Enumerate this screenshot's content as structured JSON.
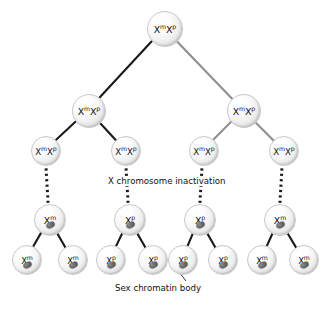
{
  "diagram": {
    "background": "#ffffff",
    "edge_color_dark": "#1a1a1a",
    "edge_color_light": "#8f8f8f",
    "chromatin_color": "#4a4a4a",
    "node_fill": "#f0f0f0"
  },
  "captions": {
    "inactivation": "X chromosome inactivation",
    "chromatin": "Sex chromatin body"
  },
  "generations": [
    {
      "level": 1,
      "nodes": [
        {
          "id": "g1n1",
          "x": 164,
          "y": 28,
          "r": 17,
          "size": "big",
          "allele1": "X",
          "sup1": "m",
          "allele2": "X",
          "sup2": "p",
          "chromatin": false
        }
      ]
    },
    {
      "level": 2,
      "nodes": [
        {
          "id": "g2n1",
          "x": 88,
          "y": 110,
          "r": 16,
          "size": "big",
          "allele1": "X",
          "sup1": "m",
          "allele2": "X",
          "sup2": "p",
          "chromatin": false
        },
        {
          "id": "g2n2",
          "x": 243,
          "y": 110,
          "r": 16,
          "size": "big",
          "allele1": "X",
          "sup1": "m",
          "allele2": "X",
          "sup2": "p",
          "chromatin": false
        }
      ]
    },
    {
      "level": 3,
      "nodes": [
        {
          "id": "g3n1",
          "x": 45,
          "y": 150,
          "r": 14,
          "size": "small",
          "allele1": "X",
          "sup1": "m",
          "allele2": "X",
          "sup2": "p",
          "chromatin": false
        },
        {
          "id": "g3n2",
          "x": 125,
          "y": 150,
          "r": 14,
          "size": "small",
          "allele1": "X",
          "sup1": "m",
          "allele2": "X",
          "sup2": "p",
          "chromatin": false
        },
        {
          "id": "g3n3",
          "x": 203,
          "y": 150,
          "r": 14,
          "size": "small",
          "allele1": "X",
          "sup1": "m",
          "allele2": "X",
          "sup2": "p",
          "chromatin": false
        },
        {
          "id": "g3n4",
          "x": 283,
          "y": 150,
          "r": 14,
          "size": "small",
          "allele1": "X",
          "sup1": "m",
          "allele2": "X",
          "sup2": "p",
          "chromatin": false
        }
      ]
    },
    {
      "level": 4,
      "nodes": [
        {
          "id": "g4n1",
          "x": 49,
          "y": 219,
          "r": 15,
          "size": "big",
          "allele1": "X",
          "sup1": "m",
          "allele2": "",
          "sup2": "",
          "chromatin": true
        },
        {
          "id": "g4n2",
          "x": 129,
          "y": 219,
          "r": 15,
          "size": "big",
          "allele1": "X",
          "sup1": "p",
          "allele2": "",
          "sup2": "",
          "chromatin": true
        },
        {
          "id": "g4n3",
          "x": 199,
          "y": 219,
          "r": 15,
          "size": "big",
          "allele1": "X",
          "sup1": "p",
          "allele2": "",
          "sup2": "",
          "chromatin": true
        },
        {
          "id": "g4n4",
          "x": 279,
          "y": 219,
          "r": 15,
          "size": "big",
          "allele1": "X",
          "sup1": "m",
          "allele2": "",
          "sup2": "",
          "chromatin": true
        }
      ]
    },
    {
      "level": 5,
      "nodes": [
        {
          "id": "g5n1",
          "x": 26,
          "y": 259,
          "r": 14,
          "size": "small",
          "allele1": "X",
          "sup1": "m",
          "allele2": "",
          "sup2": "",
          "chromatin": true
        },
        {
          "id": "g5n2",
          "x": 72,
          "y": 259,
          "r": 14,
          "size": "small",
          "allele1": "X",
          "sup1": "m",
          "allele2": "",
          "sup2": "",
          "chromatin": true
        },
        {
          "id": "g5n3",
          "x": 110,
          "y": 259,
          "r": 14,
          "size": "small",
          "allele1": "X",
          "sup1": "p",
          "allele2": "",
          "sup2": "",
          "chromatin": true
        },
        {
          "id": "g5n4",
          "x": 152,
          "y": 259,
          "r": 14,
          "size": "small",
          "allele1": "X",
          "sup1": "p",
          "allele2": "",
          "sup2": "",
          "chromatin": true
        },
        {
          "id": "g5n5",
          "x": 182,
          "y": 259,
          "r": 14,
          "size": "small",
          "allele1": "X",
          "sup1": "p",
          "allele2": "",
          "sup2": "",
          "chromatin": true
        },
        {
          "id": "g5n6",
          "x": 222,
          "y": 259,
          "r": 14,
          "size": "small",
          "allele1": "X",
          "sup1": "p",
          "allele2": "",
          "sup2": "",
          "chromatin": true
        },
        {
          "id": "g5n7",
          "x": 261,
          "y": 259,
          "r": 14,
          "size": "small",
          "allele1": "X",
          "sup1": "m",
          "allele2": "",
          "sup2": "",
          "chromatin": true
        },
        {
          "id": "g5n8",
          "x": 303,
          "y": 259,
          "r": 14,
          "size": "small",
          "allele1": "X",
          "sup1": "m",
          "allele2": "",
          "sup2": "",
          "chromatin": true
        }
      ]
    }
  ],
  "edges": [
    {
      "from": "g1n1",
      "to": "g2n1",
      "style": "solid",
      "tone": "dark"
    },
    {
      "from": "g1n1",
      "to": "g2n2",
      "style": "solid",
      "tone": "light"
    },
    {
      "from": "g2n1",
      "to": "g3n1",
      "style": "solid",
      "tone": "dark"
    },
    {
      "from": "g2n1",
      "to": "g3n2",
      "style": "solid",
      "tone": "dark"
    },
    {
      "from": "g2n2",
      "to": "g3n3",
      "style": "solid",
      "tone": "light"
    },
    {
      "from": "g2n2",
      "to": "g3n4",
      "style": "solid",
      "tone": "light"
    },
    {
      "from": "g3n1",
      "to": "g4n1",
      "style": "dashed",
      "tone": "dark"
    },
    {
      "from": "g3n2",
      "to": "g4n2",
      "style": "dashed",
      "tone": "dark"
    },
    {
      "from": "g3n3",
      "to": "g4n3",
      "style": "dashed",
      "tone": "dark"
    },
    {
      "from": "g3n4",
      "to": "g4n4",
      "style": "dashed",
      "tone": "dark"
    },
    {
      "from": "g4n1",
      "to": "g5n1",
      "style": "solid",
      "tone": "dark"
    },
    {
      "from": "g4n1",
      "to": "g5n2",
      "style": "solid",
      "tone": "dark"
    },
    {
      "from": "g4n2",
      "to": "g5n3",
      "style": "solid",
      "tone": "dark"
    },
    {
      "from": "g4n2",
      "to": "g5n4",
      "style": "solid",
      "tone": "dark"
    },
    {
      "from": "g4n3",
      "to": "g5n5",
      "style": "solid",
      "tone": "dark"
    },
    {
      "from": "g4n3",
      "to": "g5n6",
      "style": "solid",
      "tone": "dark"
    },
    {
      "from": "g4n4",
      "to": "g5n7",
      "style": "solid",
      "tone": "dark"
    },
    {
      "from": "g4n4",
      "to": "g5n8",
      "style": "solid",
      "tone": "dark"
    }
  ],
  "annotations": [
    {
      "id": "ann-inactivation",
      "text_key": "inactivation",
      "x": 106,
      "y": 176
    },
    {
      "id": "ann-chromatin",
      "text_key": "chromatin",
      "x": 113,
      "y": 283,
      "leader": {
        "x1": 186,
        "y1": 281,
        "x2": 176,
        "y2": 268
      }
    }
  ]
}
